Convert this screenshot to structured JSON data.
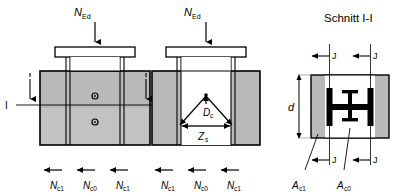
{
  "figure": {
    "title_right": "Schnitt I-I",
    "panels": [
      {
        "name": "elevation-left",
        "top_load_label_main": "N",
        "top_load_label_sub": "Ed",
        "section_marker_left": "I",
        "section_marker_right": "I",
        "reaction_labels": [
          {
            "main": "N",
            "sub": "c1"
          },
          {
            "main": "N",
            "sub": "c0"
          },
          {
            "main": "N",
            "sub": "c1"
          }
        ]
      },
      {
        "name": "elevation-middle",
        "top_load_label_main": "N",
        "top_load_label_sub": "Ed",
        "strut_label_main": "D",
        "strut_label_sub": "c",
        "tie_label_main": "Z",
        "tie_label_sub": "s",
        "reaction_labels": [
          {
            "main": "N",
            "sub": "c1"
          },
          {
            "main": "N",
            "sub": "c0"
          },
          {
            "main": "N",
            "sub": "c1"
          }
        ]
      },
      {
        "name": "cross-section",
        "depth_label": "d",
        "gap_labels_top": [
          "J",
          "J"
        ],
        "gap_labels_bottom": [
          "J",
          "J"
        ],
        "area_labels": [
          {
            "main": "A",
            "sub": "c1"
          },
          {
            "main": "A",
            "sub": "c0"
          }
        ]
      }
    ]
  },
  "colors": {
    "concrete_fill": "#b9b9b9",
    "concrete_fill_light": "#c4c4c4",
    "steel_black": "#000000",
    "plate_white": "#ffffff",
    "outline": "#000000",
    "leader_gray": "#555555"
  }
}
